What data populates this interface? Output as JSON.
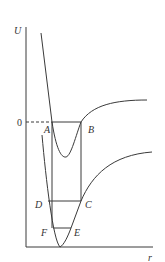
{
  "diagram": {
    "title": "",
    "axes": {
      "y_label": "U",
      "x_label": "r",
      "zero_label": "0"
    },
    "points": {
      "A": "A",
      "B": "B",
      "C": "C",
      "D": "D",
      "E": "E",
      "F": "F"
    },
    "colors": {
      "line": "#3a3a3a",
      "text": "#333333",
      "background": "#ffffff"
    }
  }
}
